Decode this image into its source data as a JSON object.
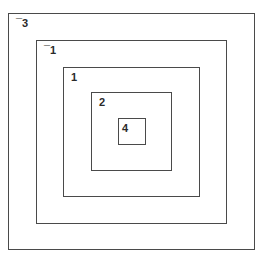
{
  "diagram": {
    "type": "nested-squares",
    "stroke_color": "#4a4a4a",
    "label_color": "#2a2a2a",
    "background": "#ffffff",
    "squares": [
      {
        "label": "¯3",
        "box": {
          "left": 8,
          "top": 13,
          "width": 247,
          "height": 237
        }
      },
      {
        "label": "¯1",
        "box": {
          "left": 36,
          "top": 40,
          "width": 191,
          "height": 184
        }
      },
      {
        "label": "1",
        "box": {
          "left": 63,
          "top": 67,
          "width": 137,
          "height": 130
        }
      },
      {
        "label": "2",
        "box": {
          "left": 91,
          "top": 92,
          "width": 81,
          "height": 79
        }
      },
      {
        "label": "4",
        "box": {
          "left": 118,
          "top": 118,
          "width": 28,
          "height": 27
        }
      }
    ]
  }
}
